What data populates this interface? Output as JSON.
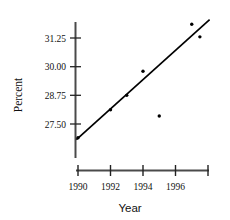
{
  "chart_data": {
    "type": "scatter",
    "title": "",
    "xlabel": "Year",
    "ylabel": "Percent",
    "xlim": [
      1989.3,
      1998.3
    ],
    "ylim": [
      26.55,
      32.15
    ],
    "grid": false,
    "legend": null,
    "x_ticks": [
      1990,
      1992,
      1994,
      1996,
      1998
    ],
    "x_tick_labels": [
      "1990",
      "1992",
      "1994",
      "1996",
      ""
    ],
    "y_ticks": [
      27.5,
      28.75,
      30.0,
      31.25
    ],
    "y_tick_labels": [
      "27.50",
      "28.75",
      "30.00",
      "31.25"
    ],
    "points": [
      {
        "x": 1990.0,
        "y": 26.9
      },
      {
        "x": 1992.0,
        "y": 28.12
      },
      {
        "x": 1993.0,
        "y": 28.75
      },
      {
        "x": 1994.0,
        "y": 29.8
      },
      {
        "x": 1995.0,
        "y": 27.85
      },
      {
        "x": 1997.0,
        "y": 31.85
      },
      {
        "x": 1997.5,
        "y": 31.3
      }
    ],
    "trend_line": {
      "type": "linear-fit",
      "x_start": 1989.9,
      "y_start": 26.82,
      "x_end": 1998.1,
      "y_end": 32.05
    },
    "marker_color": "#000000",
    "line_color": "#000000",
    "axis_color": "#444444"
  },
  "labels": {
    "x_axis_title": "Year",
    "y_axis_title": "Percent",
    "x_tick_1990": "1990",
    "x_tick_1992": "1992",
    "x_tick_1994": "1994",
    "x_tick_1996": "1996",
    "y_tick_2750": "27.50",
    "y_tick_2875": "28.75",
    "y_tick_3000": "30.00",
    "y_tick_3125": "31.25"
  }
}
